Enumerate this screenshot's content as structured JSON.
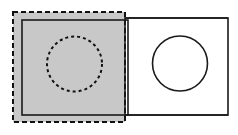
{
  "figure": {
    "canvas": {
      "width": 238,
      "height": 135,
      "background": "#ffffff"
    },
    "colors": {
      "shaded_fill": "#c8c8c8",
      "stroke": "#1a1a1a",
      "dashed_stroke": "#111111",
      "white_fill": "#ffffff"
    },
    "shapes": [
      {
        "id": "shaded-region",
        "label": "shaded-dashed-square",
        "type": "rect",
        "x": 13,
        "y": 12,
        "width": 112,
        "height": 110,
        "fill": "#c8c8c8",
        "stroke": "#111111",
        "stroke_width": 2,
        "dash": "5 3"
      },
      {
        "id": "left-square",
        "label": "solid-left-square",
        "type": "rect",
        "x": 22,
        "y": 20,
        "width": 106,
        "height": 95,
        "fill": "none",
        "stroke": "#1a1a1a",
        "stroke_width": 1.6,
        "dash": "none"
      },
      {
        "id": "right-rectangle",
        "label": "solid-right-rectangle",
        "type": "rect",
        "x": 125,
        "y": 18,
        "width": 103,
        "height": 97,
        "fill": "#ffffff",
        "stroke": "#1a1a1a",
        "stroke_width": 1.6,
        "dash": "none"
      },
      {
        "id": "left-circle",
        "label": "dashed-circle-in-shaded-square",
        "type": "circle",
        "cx": 74.5,
        "cy": 64,
        "r": 27.5,
        "fill": "none",
        "stroke": "#111111",
        "stroke_width": 2,
        "dash": "3 3"
      },
      {
        "id": "right-circle",
        "label": "solid-circle-in-right-rectangle",
        "type": "circle",
        "cx": 180,
        "cy": 63.5,
        "r": 27.5,
        "fill": "#ffffff",
        "stroke": "#1a1a1a",
        "stroke_width": 1.6,
        "dash": "none"
      }
    ],
    "labels": []
  }
}
